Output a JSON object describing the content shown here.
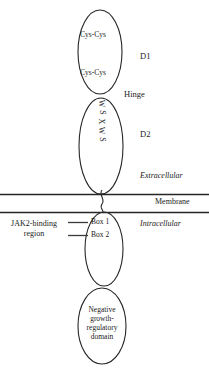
{
  "diagram": {
    "stroke_color": "#262626",
    "text_color": "#1a1a1a",
    "background": "#ffffff"
  },
  "extracellular": {
    "region_label": "Extracellular",
    "d1": {
      "label": "D1",
      "motif_upper": "Cys-Cys",
      "motif_lower": "Cys-Cys"
    },
    "hinge": {
      "label": "Hinge"
    },
    "d2": {
      "label": "D2",
      "motif": "WSXWS",
      "motif_letters": [
        "W",
        "S",
        "X",
        "W",
        "S"
      ]
    }
  },
  "membrane": {
    "label": "Membrane"
  },
  "intracellular": {
    "region_label": "Intracellular",
    "jak2_region": {
      "line1": "JAK2-binding",
      "line2": "region"
    },
    "boxes": [
      {
        "label": "Box 1"
      },
      {
        "label": "Box 2"
      }
    ],
    "negative_domain": {
      "line1": "Negative",
      "line2": "growth-",
      "line3": "regulatory",
      "line4": "domain"
    }
  }
}
